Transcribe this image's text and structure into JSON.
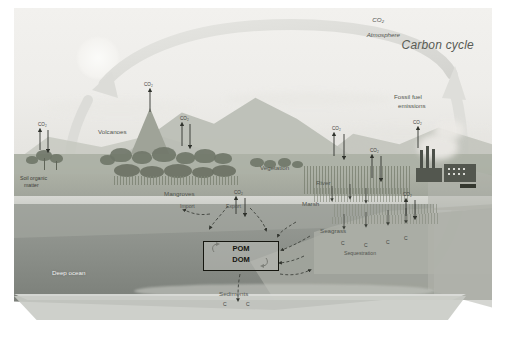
{
  "figure": {
    "title": "Carbon cycle",
    "type": "scientific-illustration"
  },
  "labels": {
    "atmosphere": "Atmosphere",
    "atmosphere_co2": "CO₂",
    "volcanoes": "Volcanoes",
    "soil_organic_matter_line1": "Soil organic",
    "soil_organic_matter_line2": "matter",
    "mangroves": "Mangroves",
    "import": "Import",
    "export": "Export",
    "vegetation": "Vegetation",
    "river": "River",
    "marsh": "Marsh",
    "seagrass": "Seagrass",
    "fossil_fuel_line1": "Fossil fuel",
    "fossil_fuel_line2": "emissions",
    "deep_ocean": "Deep ocean",
    "sediments": "Sediments",
    "c_sequestration": "Sequestration",
    "pom": "POM",
    "dom": "DOM"
  },
  "flux_markers": {
    "co2_label": "CO₂",
    "carbon_label": "C",
    "co2_sites": [
      "soil-organic-matter",
      "volcano-vent",
      "inland-forest",
      "mangroves",
      "vegetation-hillside",
      "marsh",
      "fossil-fuel-stacks",
      "seagrass-shelf"
    ],
    "carbon_sites": [
      "sequestration-shelf-1",
      "sequestration-shelf-2",
      "sequestration-shelf-3",
      "sediments-1",
      "sediments-2"
    ]
  },
  "colors": {
    "page_background": "#ffffff",
    "sky": "#f1f0ed",
    "land": "#a9ada2",
    "ocean_shallow": "#9a9d97",
    "ocean_deep": "#797d77",
    "vegetation": "#6f7568",
    "box_border": "#15160f",
    "label_text": "#52554f",
    "title_text": "#585b54",
    "arrow_ring": "#dcdcd8"
  }
}
